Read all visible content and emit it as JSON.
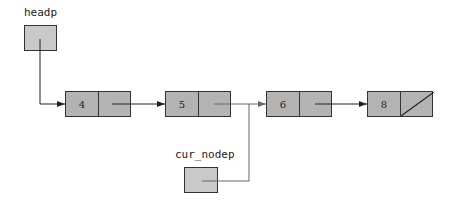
{
  "pointers": [
    {
      "name": "headp",
      "label": "headp"
    },
    {
      "name": "cur_nodep",
      "label": "cur_nodep"
    }
  ],
  "nodes": [
    {
      "value": "4",
      "next": "5"
    },
    {
      "value": "5",
      "next": "6"
    },
    {
      "value": "6",
      "next": "8"
    },
    {
      "value": "8",
      "next": null
    }
  ],
  "colors": {
    "node_fill": "#b3b3b3",
    "pointer_fill": "#c9c9c9",
    "line": "#222222",
    "cur_line": "#666666"
  }
}
